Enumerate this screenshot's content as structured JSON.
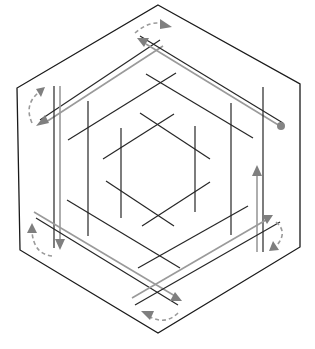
{
  "diagram": {
    "title": "",
    "colors": {
      "outline": "#1a1a1a",
      "line_black": "#262626",
      "line_gray": "#9a9a9a",
      "arrow_fill": "#7f7f7f",
      "background": "#ffffff"
    },
    "outer_hexagon": [
      [
        158,
        5
      ],
      [
        300,
        84
      ],
      [
        300,
        247
      ],
      [
        158,
        333
      ],
      [
        20,
        250
      ],
      [
        17,
        88
      ]
    ],
    "rails": [
      {
        "name": "top-left",
        "black": [
          [
            40,
            120
          ],
          [
            160,
            40
          ]
        ],
        "gray": [
          [
            40,
            125
          ],
          [
            163,
            45
          ]
        ],
        "arrow": "down-left"
      },
      {
        "name": "top-right",
        "black": [
          [
            140,
            36
          ],
          [
            283,
            123
          ]
        ],
        "gray": [
          [
            140,
            43
          ],
          [
            280,
            126
          ]
        ],
        "end_marker": "circle"
      },
      {
        "name": "left",
        "black": [
          [
            54,
            86
          ],
          [
            54,
            248
          ]
        ],
        "gray": [
          [
            60,
            86
          ],
          [
            60,
            248
          ]
        ],
        "arrow": "down"
      },
      {
        "name": "right",
        "black": [
          [
            263,
            87
          ],
          [
            263,
            252
          ]
        ],
        "gray": [
          [
            257,
            168
          ],
          [
            257,
            252
          ]
        ],
        "arrow": "up"
      },
      {
        "name": "bottom-left",
        "black": [
          [
            36,
            218
          ],
          [
            176,
            305
          ]
        ],
        "gray": [
          [
            34,
            212
          ],
          [
            180,
            300
          ]
        ],
        "arrow": "down-right"
      },
      {
        "name": "bottom-right",
        "black": [
          [
            135,
            305
          ],
          [
            280,
            222
          ]
        ],
        "gray": [
          [
            132,
            298
          ],
          [
            270,
            217
          ]
        ],
        "arrow": "up-right"
      }
    ],
    "rotation_arrows": [
      {
        "position": "top",
        "direction": "clockwise"
      },
      {
        "position": "left",
        "direction": "clockwise"
      },
      {
        "position": "bottom-left",
        "direction": "clockwise"
      },
      {
        "position": "bottom",
        "direction": "clockwise"
      },
      {
        "position": "right",
        "direction": "clockwise"
      }
    ]
  }
}
